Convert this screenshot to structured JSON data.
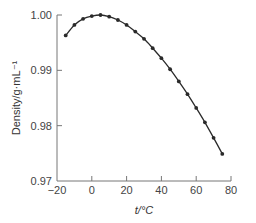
{
  "chart_data": {
    "type": "line",
    "title": "",
    "xlabel": "t/°C",
    "ylabel": "Density/g·mL⁻¹",
    "xlim": [
      -20,
      80
    ],
    "ylim": [
      0.97,
      1.0
    ],
    "x_ticks": [
      -20,
      0,
      20,
      40,
      60,
      80
    ],
    "x_tick_labels": [
      "−20",
      "0",
      "20",
      "40",
      "60",
      "80"
    ],
    "y_ticks": [
      0.97,
      0.98,
      0.99,
      1.0
    ],
    "y_tick_labels": [
      "0.97",
      "0.98",
      "0.99",
      "1.00"
    ],
    "grid": false,
    "legend": null,
    "series": [
      {
        "name": "Density of water",
        "marker": "dot",
        "color": "#2a2a2a",
        "x": [
          -15,
          -10,
          -5,
          0,
          5,
          10,
          15,
          20,
          25,
          30,
          35,
          40,
          45,
          50,
          55,
          60,
          65,
          70,
          75
        ],
        "values": [
          0.9963,
          0.9982,
          0.9993,
          0.9998,
          1.0,
          0.9997,
          0.9991,
          0.9982,
          0.997,
          0.9957,
          0.994,
          0.9922,
          0.9902,
          0.988,
          0.9857,
          0.9832,
          0.9806,
          0.9778,
          0.9749
        ]
      }
    ]
  },
  "colors": {
    "axis": "#777777",
    "line": "#2a2a2a"
  }
}
